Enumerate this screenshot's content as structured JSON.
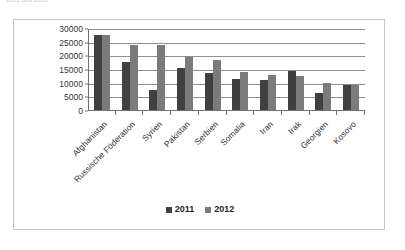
{
  "top_caption": "2011 und 2012",
  "legend": {
    "position": "bottom",
    "entries": [
      {
        "label": "2011",
        "color": "#404040"
      },
      {
        "label": "2012",
        "color": "#7b7b7b"
      }
    ]
  },
  "chart_data": {
    "type": "bar",
    "title": "",
    "subtitle": "",
    "xlabel": "",
    "ylabel": "",
    "ylim": [
      0,
      30000
    ],
    "ytick_step": 5000,
    "yticks": [
      "0",
      "5000",
      "10000",
      "15000",
      "20000",
      "25000",
      "30000"
    ],
    "grid": true,
    "legend_position": "bottom",
    "categories": [
      "Afghanistan",
      "Russische Föderation",
      "Syrien",
      "Pakistan",
      "Serbien",
      "Somalia",
      "Iran",
      "Irak",
      "Georgien",
      "Kosovo"
    ],
    "series": [
      {
        "name": "2011",
        "color": "#404040",
        "values": [
          27800,
          18000,
          7600,
          15600,
          13800,
          11800,
          11400,
          14700,
          6700,
          9500
        ]
      },
      {
        "name": "2012",
        "color": "#7b7b7b",
        "values": [
          27800,
          24200,
          24000,
          19800,
          18700,
          14100,
          13300,
          12800,
          10400,
          9600
        ]
      }
    ]
  }
}
